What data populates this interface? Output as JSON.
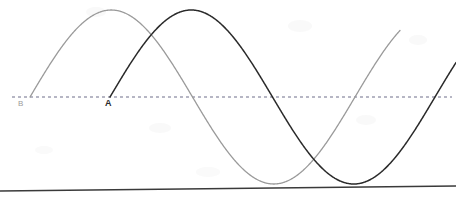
{
  "figure": {
    "width": 456,
    "height": 197,
    "background_color": "#ffffff",
    "caption": ""
  },
  "axis": {
    "name": "equilibrium-line",
    "style": "dashed",
    "color": "#6e6e8a",
    "y": 97,
    "x_start": 12,
    "x_end": 452,
    "dash_pattern": "3 3",
    "stroke_width": 1.2
  },
  "bottom_rule": {
    "name": "page-rule",
    "color": "#3a3a3a",
    "x_start": 0,
    "x_end": 456,
    "y_left": 191,
    "y_right": 186,
    "stroke_width": 1.4
  },
  "labels": [
    {
      "id": "B",
      "text": "B",
      "x": 18,
      "y": 100,
      "color": "#9b9b9b",
      "font_size": 8,
      "bold": false
    },
    {
      "id": "A",
      "text": "A",
      "x": 105,
      "y": 99,
      "color": "#2b2b2b",
      "font_size": 9,
      "bold": true
    }
  ],
  "chart_data": {
    "type": "line",
    "title": "",
    "subtitle": "",
    "xlabel": "",
    "ylabel": "",
    "grid": false,
    "legend_position": "inline-labels",
    "xlim": [
      0,
      456
    ],
    "ylim": [
      197,
      0
    ],
    "baseline_y": 97,
    "annotations": [
      {
        "label": "B",
        "x": 22,
        "y": 104,
        "note": "start of light-gray wave at equilibrium"
      },
      {
        "label": "A",
        "x": 110,
        "y": 104,
        "note": "start of dark wave at equilibrium"
      }
    ],
    "series": [
      {
        "name": "B",
        "color": "#9a9a9a",
        "stroke_width": 1.3,
        "wave": {
          "amplitude": 87,
          "wavelength": 325,
          "phase_zero_crossing_x": 30,
          "crest_x": 113,
          "crest_y": 10,
          "trough_x": 273,
          "trough_y": 183,
          "second_zero_crossing_x": 192,
          "third_zero_crossing_x": 355,
          "x_start": 30,
          "x_end": 400
        },
        "points_x": [
          30,
          71,
          113,
          152,
          192,
          233,
          273,
          314,
          355,
          378,
          400
        ],
        "points_y": [
          97,
          27,
          10,
          28,
          97,
          166,
          183,
          165,
          97,
          66,
          44
        ]
      },
      {
        "name": "A",
        "color": "#2a2a2a",
        "stroke_width": 1.5,
        "wave": {
          "amplitude": 87,
          "wavelength": 325,
          "phase_zero_crossing_x": 110,
          "crest_x": 194,
          "crest_y": 10,
          "trough_x": 355,
          "trough_y": 183,
          "second_zero_crossing_x": 274,
          "third_zero_crossing_x": 438,
          "x_start": 110,
          "x_end": 456
        },
        "points_x": [
          110,
          152,
          194,
          234,
          274,
          314,
          355,
          396,
          438,
          456
        ],
        "points_y": [
          97,
          27,
          10,
          28,
          97,
          166,
          183,
          165,
          97,
          78
        ]
      }
    ]
  }
}
